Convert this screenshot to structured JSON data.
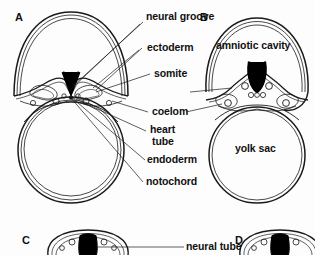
{
  "figure": {
    "background_color": "#fdfdfd",
    "line_color": "#1a1a1a",
    "fill_color": "#000000"
  },
  "panels": [
    {
      "id": "A",
      "letter": "A"
    },
    {
      "id": "B",
      "letter": "B"
    },
    {
      "id": "C",
      "letter": "C"
    },
    {
      "id": "D",
      "letter": "D"
    }
  ],
  "labels": {
    "neural_groove": "neural groove",
    "ectoderm": "ectoderm",
    "somite": "somite",
    "coelom": "coelom",
    "heart_tube_line1": "heart",
    "heart_tube_line2": "tube",
    "endoderm": "endoderm",
    "notochord": "notochord",
    "amniotic_cavity": "amniotic cavity",
    "yolk_sac": "yolk sac",
    "neural_tube": "neural tube"
  }
}
